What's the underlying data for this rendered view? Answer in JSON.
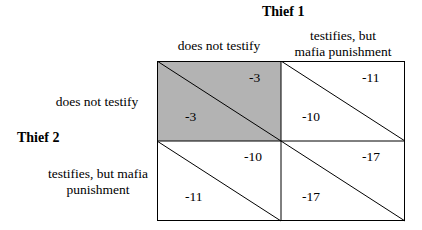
{
  "players": {
    "column_player": "Thief 1",
    "row_player": "Thief 2"
  },
  "column_strategies": [
    "does not testify",
    "testifies, but mafia punishment"
  ],
  "row_strategies": [
    "does not testify",
    "testifies, but mafia punishment"
  ],
  "column_strategy_lines": [
    [
      "does not testify"
    ],
    [
      "testifies, but",
      "mafia punishment"
    ]
  ],
  "row_strategy_lines": [
    [
      "does not testify"
    ],
    [
      "testifies, but mafia",
      "punishment"
    ]
  ],
  "payoffs": [
    [
      {
        "thief1": "-3",
        "thief2": "-3"
      },
      {
        "thief1": "-11",
        "thief2": "-10"
      }
    ],
    [
      {
        "thief1": "-10",
        "thief2": "-11"
      },
      {
        "thief1": "-17",
        "thief2": "-17"
      }
    ]
  ],
  "colors": {
    "highlight_cell": "#b3b3b3",
    "grid_line": "#000000",
    "background": "#ffffff"
  },
  "highlighted_cell": [
    0,
    0
  ]
}
